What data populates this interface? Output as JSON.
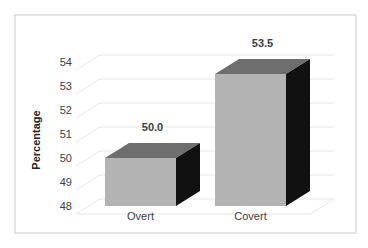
{
  "chart_data": {
    "type": "bar",
    "style": "3d-column",
    "title": "",
    "xlabel": "",
    "ylabel": "Percentage",
    "categories": [
      "Overt",
      "Covert"
    ],
    "values": [
      50.0,
      53.5
    ],
    "data_labels": [
      "50.0",
      "53.5"
    ],
    "ylim": [
      48,
      54
    ],
    "yticks": [
      "48",
      "49",
      "50",
      "51",
      "52",
      "53",
      "54"
    ],
    "grid": true,
    "legend": null,
    "colors": {
      "front": "#b3b3b3",
      "top": "#6e6e6e",
      "side": "#111111",
      "grid": "#e6e6e6",
      "frame": "#c8c8c8"
    }
  }
}
